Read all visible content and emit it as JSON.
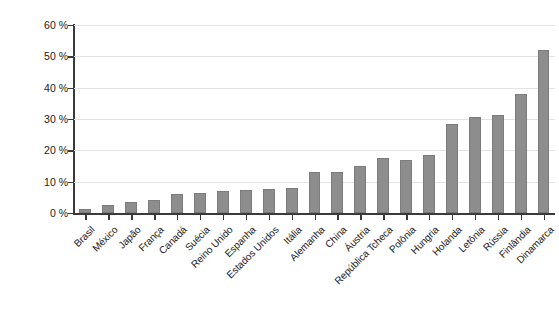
{
  "chart_data": {
    "type": "bar",
    "title": "",
    "xlabel": "",
    "ylabel": "Participação na matriz elétrica (%)",
    "ylim": [
      0,
      60
    ],
    "ytick_labels": [
      "0 %",
      "10 %",
      "20 %",
      "30 %",
      "40 %",
      "50 %",
      "60 %"
    ],
    "ytick_values": [
      0,
      10,
      20,
      30,
      40,
      50,
      60
    ],
    "grid": true,
    "legend": "none",
    "bar_color": "#8d8d8d",
    "axis_color": "#3a3a3a",
    "gridline_color": "#e3e3e3",
    "categories": [
      "Brasil",
      "México",
      "Japão",
      "França",
      "Canadá",
      "Suécia",
      "Reino Unido",
      "Espanha",
      "Estados Unidos",
      "Itália",
      "Alemanha",
      "China",
      "Áustria",
      "República Tcheca",
      "Polônia",
      "Hungria",
      "Holanda",
      "Letônia",
      "Rússia",
      "Finlândia",
      "Dinamarca"
    ],
    "values": [
      1.3,
      2.5,
      3.5,
      4.0,
      6.0,
      6.5,
      7.0,
      7.5,
      7.7,
      8.0,
      13.0,
      13.0,
      15.0,
      17.7,
      17.0,
      18.5,
      28.5,
      30.7,
      31.2,
      38.0,
      52.0
    ]
  }
}
